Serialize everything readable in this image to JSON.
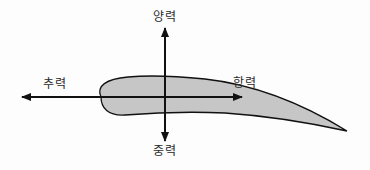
{
  "diagram": {
    "colors": {
      "airfoil_fill": "#c6c6c6",
      "stroke": "#111111",
      "background": "#fdfdfd",
      "label": "#2a2a2a"
    },
    "forces": {
      "lift": {
        "label": "양력",
        "direction": "up",
        "x": 165,
        "y": 17
      },
      "thrust": {
        "label": "추력",
        "direction": "left",
        "x": 55,
        "y": 84
      },
      "drag": {
        "label": "항력",
        "direction": "right",
        "x": 245,
        "y": 83
      },
      "gravity": {
        "label": "중력",
        "direction": "down",
        "x": 165,
        "y": 151
      }
    }
  }
}
